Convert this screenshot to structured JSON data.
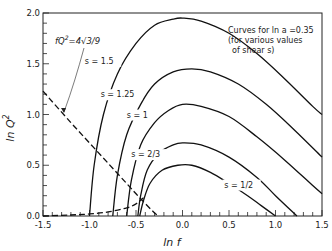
{
  "chart_data": {
    "type": "line",
    "title": "",
    "xlabel": "ln f",
    "ylabel": "ln Q²",
    "xlim": [
      -1.5,
      1.5
    ],
    "ylim": [
      0.0,
      2.0
    ],
    "grid": false,
    "xticks": [
      "-1.5",
      "-1.0",
      "-0.5",
      "0.0",
      "0.5",
      "1.0",
      "1.5"
    ],
    "yticks": [
      "0.0",
      "0.5",
      "1.0",
      "1.5",
      "2.0"
    ],
    "annotation_box": [
      "Curves for ln a = 0.35",
      "(for various values",
      "of shear s)"
    ],
    "dashed_curve_label": "f Q² = 4√3/9",
    "series": [
      {
        "name": "s = 1.5",
        "x": [
          -1.0,
          -0.95,
          -0.85,
          -0.7,
          -0.5,
          -0.3,
          -0.1,
          0.0,
          0.2,
          0.5,
          0.8,
          1.1,
          1.4,
          1.5
        ],
        "y": [
          0.0,
          0.5,
          1.0,
          1.4,
          1.7,
          1.88,
          1.94,
          1.95,
          1.92,
          1.8,
          1.6,
          1.35,
          1.08,
          1.0
        ]
      },
      {
        "name": "s = 1.25",
        "x": [
          -0.75,
          -0.7,
          -0.6,
          -0.45,
          -0.3,
          -0.1,
          0.1,
          0.3,
          0.6,
          0.9,
          1.2,
          1.5
        ],
        "y": [
          0.0,
          0.4,
          0.8,
          1.1,
          1.3,
          1.42,
          1.45,
          1.42,
          1.3,
          1.1,
          0.85,
          0.58
        ]
      },
      {
        "name": "s = 1",
        "x": [
          -0.6,
          -0.55,
          -0.45,
          -0.3,
          -0.15,
          0.0,
          0.2,
          0.5,
          0.8,
          1.1,
          1.4,
          1.5
        ],
        "y": [
          0.0,
          0.35,
          0.7,
          0.92,
          1.04,
          1.1,
          1.08,
          0.98,
          0.78,
          0.55,
          0.3,
          0.22
        ]
      },
      {
        "name": "s = 2/3",
        "x": [
          -0.48,
          -0.45,
          -0.38,
          -0.25,
          -0.1,
          0.0,
          0.2,
          0.5,
          0.8,
          1.0,
          1.23
        ],
        "y": [
          0.0,
          0.2,
          0.45,
          0.62,
          0.7,
          0.72,
          0.7,
          0.58,
          0.38,
          0.2,
          0.0
        ]
      },
      {
        "name": "s = 1/2",
        "x": [
          -0.46,
          -0.42,
          -0.35,
          -0.22,
          -0.05,
          0.1,
          0.3,
          0.5,
          0.7,
          0.85,
          1.0
        ],
        "y": [
          0.0,
          0.15,
          0.32,
          0.45,
          0.5,
          0.5,
          0.43,
          0.32,
          0.2,
          0.1,
          0.0
        ]
      },
      {
        "name": "f Q² = 4√3/9 (dashed)",
        "x": [
          -1.5,
          -1.2,
          -1.0,
          -0.8,
          -0.6,
          -0.45,
          -0.3,
          -0.25
        ],
        "y": [
          1.23,
          0.92,
          0.72,
          0.52,
          0.32,
          0.17,
          0.03,
          0.0
        ]
      },
      {
        "name": "lower dashed curve",
        "x": [
          -1.5,
          -1.2,
          -1.0,
          -0.8,
          -0.6,
          -0.5,
          -0.42
        ],
        "y": [
          0.0,
          0.01,
          0.02,
          0.04,
          0.08,
          0.12,
          0.18
        ]
      }
    ],
    "curve_labels": [
      {
        "text": "s = 1.5",
        "x": -1.05,
        "y": 1.5
      },
      {
        "text": "s = 1.25",
        "x": -0.88,
        "y": 1.17
      },
      {
        "text": "s = 1",
        "x": -0.6,
        "y": 0.97
      },
      {
        "text": "s = 2/3",
        "x": -0.55,
        "y": 0.58
      },
      {
        "text": "s = 1/2",
        "x": 0.45,
        "y": 0.28
      }
    ]
  },
  "labels": {
    "xlabel": "ln f",
    "ylabel": "ln Q",
    "ylabel_sup": "2",
    "box1": "Curves for ln a =0.35",
    "box2": "(for various values",
    "box3": "of shear s)",
    "dash_label": "fQ",
    "dash_label_sup": "2",
    "dash_label_rest": "=4√3/9"
  }
}
